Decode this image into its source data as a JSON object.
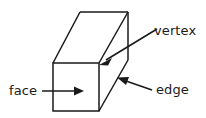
{
  "diagram": {
    "shape_name": "cuboid",
    "background_color": "#ffffff",
    "line_color": "#1a1a1a",
    "labels": {
      "vertex": "vertex",
      "face": "face",
      "edge": "edge"
    },
    "annotations": [
      {
        "id": "vertex",
        "label": "vertex",
        "target": "front-top-right corner of the cuboid",
        "arrow_from": [
          156,
          30
        ],
        "arrow_to": [
          100,
          64
        ]
      },
      {
        "id": "face",
        "label": "face",
        "target": "front square face of the cuboid",
        "arrow_from": [
          42,
          91
        ],
        "arrow_to": [
          83,
          91
        ]
      },
      {
        "id": "edge",
        "label": "edge",
        "target": "lower-right slanted edge of the cuboid",
        "arrow_from": [
          152,
          90
        ],
        "arrow_to": [
          118,
          78
        ]
      }
    ],
    "geometry": {
      "front_face": [
        [
          53,
          63
        ],
        [
          99,
          63
        ],
        [
          99,
          111
        ],
        [
          53,
          111
        ]
      ],
      "back_top_left": [
        80,
        12
      ],
      "back_top_right": [
        128,
        12
      ],
      "back_bottom_right": [
        128,
        60
      ],
      "visible_edges": [
        "front face square",
        "front-top-left to back-top-left",
        "front-top-right to back-top-right",
        "front-bottom-right to back-bottom-right",
        "back top edge",
        "back right vertical edge"
      ]
    }
  }
}
